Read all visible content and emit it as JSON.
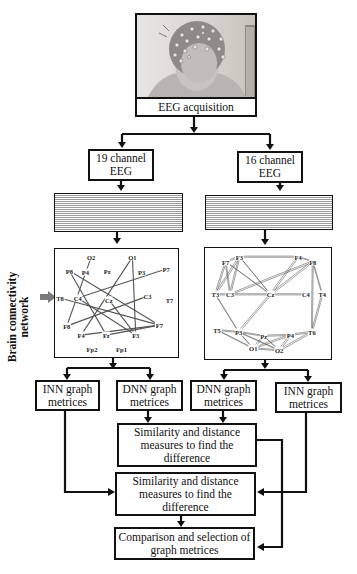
{
  "acquisition": {
    "label": "EEG acquisition",
    "image_alt": "head-with-eeg-cap"
  },
  "branches": {
    "left": {
      "channel_label_line1": "19 channel",
      "channel_label_line2": "EEG"
    },
    "right": {
      "channel_label_line1": "16 channel",
      "channel_label_line2": "EEG"
    }
  },
  "side_label": {
    "line1": "Brain connectivity",
    "line2": "network"
  },
  "graph_left": {
    "nodes": [
      {
        "id": "O2",
        "x": 43,
        "y": 9
      },
      {
        "id": "O1",
        "x": 92,
        "y": 9
      },
      {
        "id": "P8",
        "x": 17,
        "y": 24
      },
      {
        "id": "P4",
        "x": 36,
        "y": 25
      },
      {
        "id": "Pz",
        "x": 62,
        "y": 24
      },
      {
        "id": "P3",
        "x": 103,
        "y": 25
      },
      {
        "id": "P7",
        "x": 132,
        "y": 22
      },
      {
        "id": "T8",
        "x": 6,
        "y": 54
      },
      {
        "id": "C4",
        "x": 27,
        "y": 54
      },
      {
        "id": "Cz",
        "x": 64,
        "y": 56
      },
      {
        "id": "C3",
        "x": 110,
        "y": 52
      },
      {
        "id": "T7",
        "x": 136,
        "y": 56
      },
      {
        "id": "F8",
        "x": 14,
        "y": 85
      },
      {
        "id": "F7",
        "x": 124,
        "y": 84
      },
      {
        "id": "F4",
        "x": 31,
        "y": 95
      },
      {
        "id": "Fz",
        "x": 61,
        "y": 95
      },
      {
        "id": "F3",
        "x": 96,
        "y": 95
      },
      {
        "id": "Fp2",
        "x": 44,
        "y": 110
      },
      {
        "id": "Fp1",
        "x": 79,
        "y": 110
      }
    ],
    "edges": [
      [
        "O2",
        "F8"
      ],
      [
        "O1",
        "F4"
      ],
      [
        "O1",
        "F3"
      ],
      [
        "P8",
        "Fz"
      ],
      [
        "P8",
        "F7"
      ],
      [
        "T8",
        "F7"
      ],
      [
        "C4",
        "P7"
      ],
      [
        "C4",
        "F3"
      ],
      [
        "F8",
        "C3"
      ],
      [
        "F4",
        "F7"
      ],
      [
        "Fz",
        "F7"
      ],
      [
        "Cz",
        "F3"
      ]
    ]
  },
  "graph_right": {
    "nodes": [
      {
        "id": "F3",
        "x": 40,
        "y": 9
      },
      {
        "id": "F4",
        "x": 108,
        "y": 9
      },
      {
        "id": "F7",
        "x": 24,
        "y": 14
      },
      {
        "id": "F8",
        "x": 125,
        "y": 14
      },
      {
        "id": "T3",
        "x": 12,
        "y": 48
      },
      {
        "id": "C3",
        "x": 29,
        "y": 48
      },
      {
        "id": "Cz",
        "x": 76,
        "y": 48
      },
      {
        "id": "C4",
        "x": 117,
        "y": 48
      },
      {
        "id": "T4",
        "x": 136,
        "y": 48
      },
      {
        "id": "T5",
        "x": 14,
        "y": 85
      },
      {
        "id": "P3",
        "x": 39,
        "y": 87
      },
      {
        "id": "Pz",
        "x": 68,
        "y": 91
      },
      {
        "id": "P4",
        "x": 99,
        "y": 90
      },
      {
        "id": "T6",
        "x": 124,
        "y": 87
      },
      {
        "id": "O1",
        "x": 56,
        "y": 104
      },
      {
        "id": "O2",
        "x": 86,
        "y": 106
      }
    ],
    "edges": [
      [
        "F7",
        "F3"
      ],
      [
        "F7",
        "T3"
      ],
      [
        "F7",
        "C3"
      ],
      [
        "F3",
        "T3"
      ],
      [
        "F3",
        "C3"
      ],
      [
        "F3",
        "Cz"
      ],
      [
        "F3",
        "F4"
      ],
      [
        "F7",
        "Cz"
      ],
      [
        "F4",
        "F8"
      ],
      [
        "F4",
        "Cz"
      ],
      [
        "F8",
        "Cz"
      ],
      [
        "F8",
        "C3"
      ],
      [
        "F8",
        "T4"
      ],
      [
        "F8",
        "T6"
      ],
      [
        "T3",
        "C3"
      ],
      [
        "C3",
        "Cz"
      ],
      [
        "Cz",
        "C4"
      ],
      [
        "T4",
        "T6"
      ],
      [
        "T3",
        "P3"
      ],
      [
        "Cz",
        "P3"
      ],
      [
        "T5",
        "P3"
      ],
      [
        "T5",
        "O1"
      ],
      [
        "P3",
        "Pz"
      ],
      [
        "P3",
        "O1"
      ],
      [
        "P3",
        "O2"
      ],
      [
        "Pz",
        "P4"
      ],
      [
        "Pz",
        "O1"
      ],
      [
        "Pz",
        "O2"
      ],
      [
        "P4",
        "T6"
      ],
      [
        "P4",
        "O1"
      ],
      [
        "P4",
        "O2"
      ],
      [
        "T6",
        "O2"
      ],
      [
        "O1",
        "O2"
      ]
    ]
  },
  "metrics": {
    "left_inn": {
      "line1": "INN graph",
      "line2": "metrices"
    },
    "left_dnn": {
      "line1": "DNN graph",
      "line2": "metrices"
    },
    "right_dnn": {
      "line1": "DNN graph",
      "line2": "metrices"
    },
    "right_inn": {
      "line1": "INN graph",
      "line2": "metrices"
    }
  },
  "similarity_dnn": {
    "line1": "Similarity and distance",
    "line2": "measures to find the",
    "line3": "difference"
  },
  "similarity_inn": {
    "line1": "Similarity and distance",
    "line2": "measures to find the",
    "line3": "difference"
  },
  "final": {
    "line1": "Comparison and selection of",
    "line2": "graph metrices"
  },
  "colors": {
    "stroke": "#111111",
    "edge": "#555555",
    "arrow_marker": "#7a7a7a"
  }
}
